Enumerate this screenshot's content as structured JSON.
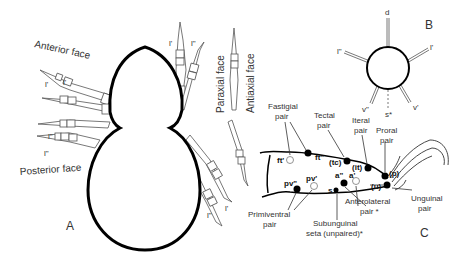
{
  "panel_a": {
    "panel_label": "A",
    "face_labels": {
      "anterior": "Anterior face",
      "posterior": "Posterior face",
      "paraxial": "Paraxial face",
      "antiaxial": "Antiaxial face"
    },
    "leg_setae": {
      "anterior_l_prime_1": "l'",
      "anterior_l_prime_2": "l'",
      "posterior_l_dprime_1": "l\"",
      "posterior_l_dprime_2": "l\"",
      "top_l_prime": "l'",
      "top_l_dprime": "l\"",
      "bottom_l_dprime": "l\"",
      "bottom_l_prime": "l'"
    }
  },
  "panel_b": {
    "panel_label": "B",
    "setae": {
      "d": "d",
      "l_dprime": "l\"",
      "l_prime": "l'",
      "v_dprime": "v\"",
      "v_prime": "v'",
      "s": "s*"
    }
  },
  "panel_c": {
    "panel_label": "C",
    "pair_labels": {
      "fastigial": [
        "Fastigial",
        "pair"
      ],
      "tectal": [
        "Tectal",
        "pair"
      ],
      "iteral": [
        "Iteral",
        "pair"
      ],
      "proral": [
        "Proral",
        "pair"
      ],
      "unguinal": [
        "Unguinal",
        "pair"
      ],
      "anterolateral": [
        "Anterolateral",
        "pair *"
      ],
      "subunguinal": [
        "Subunguinal",
        "seta (unpaired)*"
      ],
      "primiventral": [
        "Primiventral",
        "pair"
      ]
    },
    "setae": {
      "ft_prime": "ft'",
      "ft_dprime": "ft\"",
      "tc": "(tc)",
      "it": "(it)",
      "p": "(p)",
      "u": "(u)",
      "a_dprime": "a\"",
      "a_prime": "a'",
      "s": "s",
      "pv_dprime": "pv\"",
      "pv_prime": "pv'"
    }
  },
  "colors": {
    "outline": "#000000",
    "thin_line": "#444444",
    "text": "#333333",
    "background": "#ffffff"
  }
}
